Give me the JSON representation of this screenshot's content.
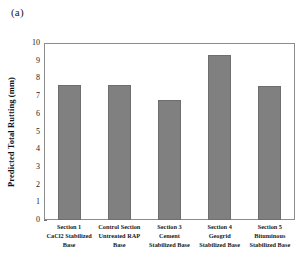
{
  "figure": {
    "panel_label": "(a)"
  },
  "chart_data": {
    "type": "bar",
    "title": "",
    "xlabel": "",
    "ylabel": "Predicted Total Rutting (mm)",
    "ylim": [
      0,
      10
    ],
    "ytick_step": 1,
    "yticks": [
      "10",
      "9",
      "8",
      "7",
      "6",
      "5",
      "4",
      "3",
      "2",
      "1",
      "0"
    ],
    "grid": false,
    "legend": "none",
    "bar_color": "#808080",
    "bar_edge_color": "#6e6e6e",
    "axis_color": "#8c8c8c",
    "categories": [
      "Section 1 CaCl2 Stabilized Base",
      "Control Section Untreated RAP Base",
      "Section 3 Cement Stabilized Base",
      "Section 4 Geogrid Stabilized Base",
      "Section 5 Bituminous Stabilized Base"
    ],
    "category_lines": [
      [
        "Section 1",
        "CaCl2 Stabilized",
        "Base"
      ],
      [
        "Control Section",
        "Untreated RAP",
        "Base"
      ],
      [
        "Section 3",
        "Cement",
        "Stabilized Base"
      ],
      [
        "Section 4",
        "Geogrid",
        "Stabilized Base"
      ],
      [
        "Section 5",
        "Bituminous",
        "Stabilized Base"
      ]
    ],
    "values": [
      7.6,
      7.6,
      6.8,
      9.35,
      7.55
    ]
  }
}
